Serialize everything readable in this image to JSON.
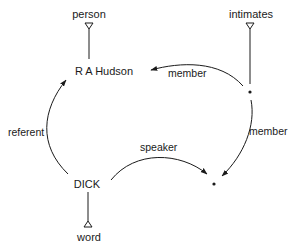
{
  "diagram": {
    "type": "word-grammar network",
    "nodes": {
      "person": "person",
      "hudson": "R A Hudson",
      "intimates": "intimates",
      "dick": "DICK",
      "word": "word",
      "dot_top": "",
      "dot_bottom": ""
    },
    "edges": {
      "member_top": "member",
      "member_right": "member",
      "referent": "referent",
      "speaker": "speaker"
    },
    "relations": [
      {
        "from": "DICK",
        "to": "R A Hudson",
        "label": "referent"
      },
      {
        "from": "DICK",
        "to": "dot_bottom",
        "label": "speaker"
      },
      {
        "from": "dot_top",
        "to": "R A Hudson",
        "label": "member"
      },
      {
        "from": "dot_top",
        "to": "dot_bottom",
        "label": "member"
      },
      {
        "from": "R A Hudson",
        "isa": "person"
      },
      {
        "from": "dot_top",
        "isa": "intimates"
      },
      {
        "from": "DICK",
        "isa": "word"
      }
    ],
    "colors": {
      "line": "#1a1a1a",
      "background": "#ffffff"
    }
  }
}
